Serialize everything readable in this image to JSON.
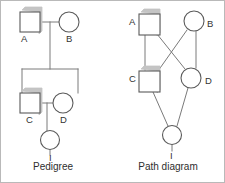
{
  "figure": {
    "width": 225,
    "height": 183,
    "background": "#ffffff",
    "border_color": "#b9b9b9",
    "stroke_color": "#7a7a7a",
    "shape_stroke_color": "#5a5a5a",
    "shadow_color": "#c4c4c4",
    "label_color": "#333333"
  },
  "panels": [
    {
      "id": "pedigree",
      "caption": "Pedigree",
      "caption_x": 52,
      "caption_y": 164,
      "nodes": [
        {
          "id": "A",
          "label": "A",
          "sex": "male",
          "shape": "square",
          "cx": 29,
          "cy": 21,
          "size": 20,
          "label_x": 20,
          "label_y": 38
        },
        {
          "id": "B",
          "label": "B",
          "sex": "female",
          "shape": "circle",
          "cx": 68,
          "cy": 21,
          "size": 20,
          "label_x": 65,
          "label_y": 38
        },
        {
          "id": "C",
          "label": "C",
          "sex": "male",
          "shape": "square",
          "cx": 29,
          "cy": 102,
          "size": 20,
          "label_x": 25,
          "label_y": 119
        },
        {
          "id": "D",
          "label": "D",
          "sex": "female",
          "shape": "circle",
          "cx": 62,
          "cy": 102,
          "size": 20,
          "label_x": 59,
          "label_y": 119
        },
        {
          "id": "I",
          "label": "I",
          "sex": "female",
          "shape": "circle",
          "cx": 49,
          "cy": 139,
          "size": 19,
          "label_x": 48,
          "label_y": 157
        }
      ],
      "links": [
        {
          "from": "A",
          "to": "B",
          "type": "mating-line",
          "points": "39,21 58,21"
        },
        {
          "from": "A-B",
          "to": "sibship",
          "type": "descent-line",
          "points": "49,21 49,68"
        },
        {
          "from": "sibship",
          "to": "bar",
          "type": "sibship-bar",
          "points": "21,68 77,68"
        },
        {
          "from": "bar",
          "to": "C",
          "type": "sibling-drop",
          "points": "21,68 21,92"
        },
        {
          "from": "bar",
          "to": "D",
          "type": "sibling-drop",
          "points": "77,68 77,92"
        },
        {
          "from": "C",
          "to": "D",
          "type": "mating-line",
          "points": "39,102 52,102"
        },
        {
          "from": "C-D",
          "to": "I",
          "type": "descent-line",
          "points": "46,102 46,130"
        },
        {
          "from": "I",
          "to": "stub",
          "type": "label-stub",
          "points": "49,148 49,154"
        }
      ]
    },
    {
      "id": "path-diagram",
      "caption": "Path diagram",
      "caption_x": 167,
      "caption_y": 164,
      "nodes": [
        {
          "id": "A",
          "label": "A",
          "sex": "male",
          "shape": "square",
          "cx": 148,
          "cy": 23,
          "size": 21,
          "label_x": 131,
          "label_y": 20
        },
        {
          "id": "B",
          "label": "B",
          "sex": "female",
          "shape": "circle",
          "cx": 193,
          "cy": 20,
          "size": 20,
          "label_x": 208,
          "label_y": 23
        },
        {
          "id": "C",
          "label": "C",
          "sex": "male",
          "shape": "square",
          "cx": 148,
          "cy": 80,
          "size": 21,
          "label_x": 131,
          "label_y": 78
        },
        {
          "id": "D",
          "label": "D",
          "sex": "female",
          "shape": "circle",
          "cx": 190,
          "cy": 77,
          "size": 20,
          "label_x": 206,
          "label_y": 80
        },
        {
          "id": "I",
          "label": "I",
          "sex": "female",
          "shape": "circle",
          "cx": 171,
          "cy": 134,
          "size": 19,
          "label_x": 170,
          "label_y": 155
        }
      ],
      "links": [
        {
          "from": "A",
          "to": "C",
          "type": "path",
          "points": "144,34 144,69"
        },
        {
          "from": "B",
          "to": "D",
          "type": "path",
          "points": "195,30 195,67"
        },
        {
          "from": "A",
          "to": "D",
          "type": "cross-path",
          "points": "156,33 184,68"
        },
        {
          "from": "B",
          "to": "C",
          "type": "cross-path",
          "points": "186,29 157,70"
        },
        {
          "from": "C",
          "to": "I",
          "type": "path",
          "points": "152,91 167,125"
        },
        {
          "from": "D",
          "to": "I",
          "type": "path",
          "points": "187,87 176,125"
        },
        {
          "from": "I",
          "to": "stub",
          "type": "label-stub",
          "points": "171,143 171,150"
        }
      ]
    }
  ]
}
